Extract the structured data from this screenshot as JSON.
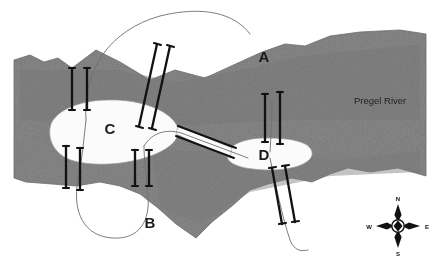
{
  "map": {
    "title": "Seven Bridges of Koenigsberg",
    "river_label": "Pregel River",
    "regions": [
      {
        "id": "A",
        "label": "A",
        "name": "north-bank",
        "x": 264,
        "y": 62
      },
      {
        "id": "B",
        "label": "B",
        "name": "south-bank",
        "x": 150,
        "y": 228
      },
      {
        "id": "C",
        "label": "C",
        "name": "kneiphof-island",
        "x": 110,
        "y": 134
      },
      {
        "id": "D",
        "label": "D",
        "name": "east-island",
        "x": 264,
        "y": 160
      }
    ],
    "colors": {
      "water": "#8a8a8a",
      "water_dark": "#7c7c7c",
      "land": "#ffffff",
      "bridge": "#121212",
      "road": "#6f6f6f",
      "text": "#1a1a1a"
    },
    "bridge_count": 7
  },
  "compass": {
    "name": "compass-rose",
    "north": "N",
    "east": "E",
    "south": "S",
    "west": "W",
    "cx": 398,
    "cy": 226
  }
}
